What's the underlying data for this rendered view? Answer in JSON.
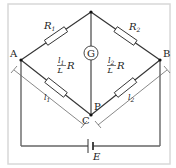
{
  "diagram": {
    "type": "Wheatstone bridge (slide-wire / meter bridge) circuit",
    "nodes": {
      "A": "A",
      "B": "B",
      "C": "C",
      "P": "P"
    },
    "galvanometer": {
      "label": "G"
    },
    "resistors": {
      "r1": {
        "symbol": "R",
        "sub": "1"
      },
      "r2": {
        "symbol": "R",
        "sub": "2"
      },
      "left_wire": {
        "num": "l",
        "num_sub": "1",
        "den": "L",
        "factor": "R"
      },
      "right_wire": {
        "num": "l",
        "num_sub": "2",
        "den": "L",
        "factor": "R"
      }
    },
    "lengths": {
      "left": {
        "symbol": "l",
        "sub": "1"
      },
      "right": {
        "symbol": "l",
        "sub": "2"
      }
    },
    "battery": {
      "label": "E"
    },
    "colors": {
      "wire": "#333333",
      "frame": "#d8d8d8",
      "background": "#ffffff"
    }
  }
}
